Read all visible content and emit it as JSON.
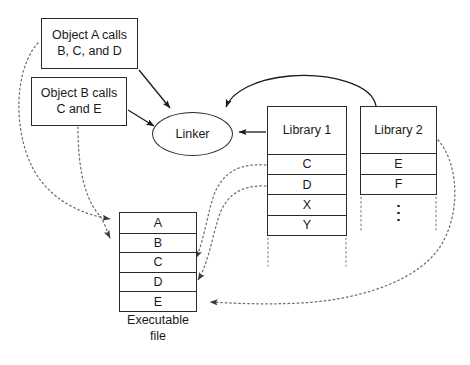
{
  "diagram": {
    "background_color": "#ffffff",
    "stroke_color": "#2a2a2a"
  },
  "objects": {
    "object_a": {
      "line1": "Object A calls",
      "line2": "B, C, and D"
    },
    "object_b": {
      "line1": "Object B calls",
      "line2": "C and E"
    }
  },
  "linker": {
    "label": "Linker"
  },
  "library_1": {
    "title": "Library 1",
    "entries": [
      "C",
      "D",
      "X",
      "Y"
    ]
  },
  "library_2": {
    "title": "Library 2",
    "entries": [
      "E",
      "F"
    ],
    "continuation": "⋮"
  },
  "executable": {
    "entries": [
      "A",
      "B",
      "C",
      "D",
      "E"
    ],
    "caption_line1": "Executable",
    "caption_line2": "file"
  },
  "edges": {
    "object_a_to_linker": "solid arrow",
    "object_b_to_linker": "solid arrow",
    "library1_to_linker": "solid arrow",
    "library2_to_linker": "solid curved arrow",
    "object_a_to_exec_a": "dotted arrow",
    "object_b_to_exec_b": "dotted arrow",
    "library1_c_to_exec_c": "dotted arrow",
    "library1_d_to_exec_d": "dotted arrow",
    "library2_e_to_exec_e": "dotted arrow"
  }
}
